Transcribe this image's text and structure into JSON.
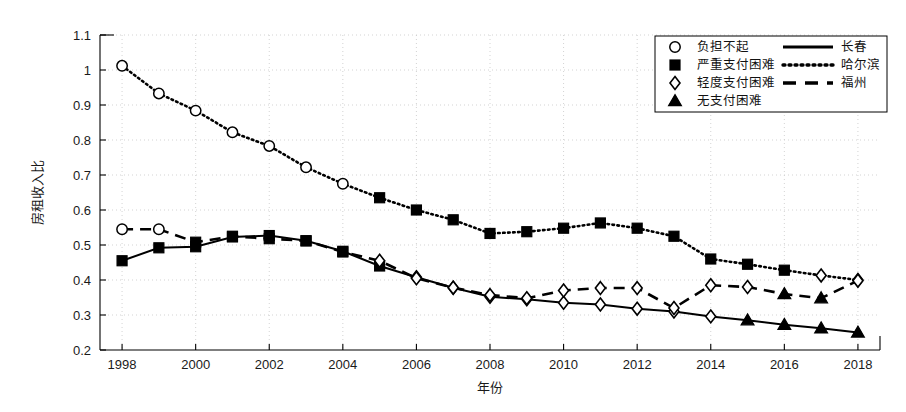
{
  "chart_data": {
    "type": "line",
    "title": "",
    "xlabel": "年份",
    "ylabel": "房租收入比",
    "xlim": [
      1997.4,
      2018.6
    ],
    "ylim": [
      0.2,
      1.1
    ],
    "ytick_labels": [
      "0.2",
      "0.3",
      "0.4",
      "0.5",
      "0.6",
      "0.7",
      "0.8",
      "0.9",
      "1",
      "1.1"
    ],
    "ytick_values": [
      0.2,
      0.3,
      0.4,
      0.5,
      0.6,
      0.7,
      0.8,
      0.9,
      1.0,
      1.1
    ],
    "xtick_labels": [
      "1998",
      "2000",
      "2002",
      "2004",
      "2006",
      "2008",
      "2010",
      "2012",
      "2014",
      "2016",
      "2018"
    ],
    "xtick_values": [
      1998,
      2000,
      2002,
      2004,
      2006,
      2008,
      2010,
      2012,
      2014,
      2016,
      2018
    ],
    "grid": true,
    "grid_style": "dotted",
    "legend_position": "top-right",
    "x": [
      1998,
      1999,
      2000,
      2001,
      2002,
      2003,
      2004,
      2005,
      2006,
      2007,
      2008,
      2009,
      2010,
      2011,
      2012,
      2013,
      2014,
      2015,
      2016,
      2017,
      2018
    ],
    "series": [
      {
        "name": "长春",
        "line_style": "solid",
        "values": [
          0.455,
          0.492,
          0.495,
          0.523,
          0.527,
          0.512,
          0.482,
          0.44,
          0.408,
          0.378,
          0.352,
          0.345,
          0.335,
          0.33,
          0.318,
          0.31,
          0.296,
          0.285,
          0.272,
          0.262,
          0.25
        ],
        "markers": [
          "square",
          "square",
          "square",
          "square",
          "square",
          "square",
          "square",
          "square",
          "diamond",
          "diamond",
          "diamond",
          "diamond",
          "diamond",
          "diamond",
          "diamond",
          "diamond",
          "diamond",
          "triangle",
          "triangle",
          "triangle",
          "triangle"
        ]
      },
      {
        "name": "哈尔滨",
        "line_style": "dotted",
        "values": [
          1.012,
          0.933,
          0.884,
          0.822,
          0.783,
          0.722,
          0.675,
          0.635,
          0.6,
          0.572,
          0.533,
          0.538,
          0.548,
          0.563,
          0.548,
          0.525,
          0.46,
          0.445,
          0.428,
          0.413,
          0.4
        ],
        "markers": [
          "circle",
          "circle",
          "circle",
          "circle",
          "circle",
          "circle",
          "circle",
          "square",
          "square",
          "square",
          "square",
          "square",
          "square",
          "square",
          "square",
          "square",
          "square",
          "square",
          "square",
          "diamond",
          "diamond"
        ]
      },
      {
        "name": "福州",
        "line_style": "dashed",
        "values": [
          0.545,
          0.545,
          0.508,
          0.525,
          0.518,
          0.512,
          0.48,
          0.455,
          0.405,
          0.378,
          0.357,
          0.348,
          0.37,
          0.377,
          0.377,
          0.32,
          0.385,
          0.38,
          0.36,
          0.348,
          0.398
        ],
        "markers": [
          "circle",
          "circle",
          "square",
          "square",
          "square",
          "square",
          "square",
          "diamond",
          "diamond",
          "diamond",
          "diamond",
          "diamond",
          "diamond",
          "diamond",
          "diamond",
          "diamond",
          "diamond",
          "diamond",
          "triangle",
          "triangle",
          "diamond"
        ]
      }
    ],
    "marker_legend": [
      {
        "marker": "circle",
        "label": "负担不起"
      },
      {
        "marker": "square",
        "label": "严重支付困难"
      },
      {
        "marker": "diamond",
        "label": "轻度支付困难"
      },
      {
        "marker": "triangle",
        "label": "无支付困难"
      }
    ],
    "line_legend": [
      {
        "line_style": "solid",
        "label": "长春"
      },
      {
        "line_style": "dotted",
        "label": "哈尔滨"
      },
      {
        "line_style": "dashed",
        "label": "福州"
      }
    ],
    "colors": {
      "line": "#000000",
      "grid": "#c8c8c8",
      "axis": "#000000",
      "background": "#ffffff"
    }
  }
}
